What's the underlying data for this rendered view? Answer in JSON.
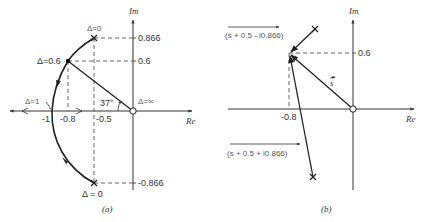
{
  "panel_a": {
    "caption": "(a)",
    "axis_re": "Re",
    "axis_im": "Im",
    "x_ticks": [
      "-1",
      "-0.8",
      "-0.5"
    ],
    "y_ticks": [
      "0.866",
      "0.6",
      "-0.866"
    ],
    "angle_label": "37°",
    "points": {
      "delta0_top": "Δ=0",
      "delta06": "Δ=0.6",
      "delta1": "Δ=1",
      "delta_inf": "Δ=∞",
      "delta0_bottom": "Δ = 0"
    }
  },
  "panel_b": {
    "caption": "(b)",
    "axis_re": "Re",
    "axis_im": "Im",
    "x_tick": "-0.8",
    "y_tick": "0.6",
    "vector_s": "s",
    "vector_upper": "(s + 0.5 - i0.866)",
    "vector_lower": "(s + 0.5 + i0.866)"
  }
}
